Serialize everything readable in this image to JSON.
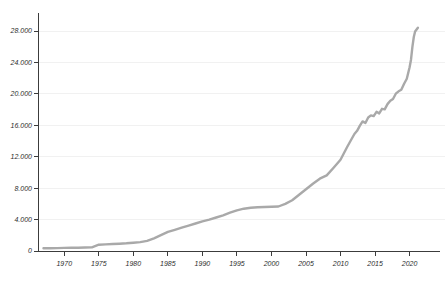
{
  "window": {
    "background": "#ffffff"
  },
  "chart_data": {
    "type": "line",
    "title": "",
    "xlabel": "",
    "ylabel": "",
    "legend": "none",
    "grid": "horizontal-faint",
    "colors": {
      "line": "#a9a9a9",
      "axis": "#3c3c3c",
      "grid": "#f1f1f1",
      "tick_label": "#2d2d2d"
    },
    "xlim": [
      1966.2,
      2024.4
    ],
    "ylim": [
      0,
      30300
    ],
    "x_ticks": [
      1970,
      1975,
      1980,
      1985,
      1990,
      1995,
      2000,
      2005,
      2010,
      2015,
      2020
    ],
    "x_tick_labels": [
      "1970",
      "1975",
      "1980",
      "1985",
      "1990",
      "1995",
      "2000",
      "2005",
      "2010",
      "2015",
      "2020"
    ],
    "y_ticks": [
      0,
      4000,
      8000,
      12000,
      16000,
      20000,
      24000,
      28000
    ],
    "y_tick_labels": [
      "0",
      "4.000",
      "8.000",
      "12.000",
      "16.000",
      "20.000",
      "24.000",
      "28.000"
    ],
    "series": [
      {
        "name": "series-1",
        "points": [
          [
            1967,
            350
          ],
          [
            1968,
            360
          ],
          [
            1969,
            375
          ],
          [
            1970,
            390
          ],
          [
            1971,
            405
          ],
          [
            1972,
            420
          ],
          [
            1973,
            440
          ],
          [
            1974,
            460
          ],
          [
            1975,
            800
          ],
          [
            1976,
            845
          ],
          [
            1977,
            890
          ],
          [
            1978,
            935
          ],
          [
            1979,
            985
          ],
          [
            1980,
            1060
          ],
          [
            1981,
            1130
          ],
          [
            1982,
            1290
          ],
          [
            1983,
            1600
          ],
          [
            1984,
            2010
          ],
          [
            1985,
            2450
          ],
          [
            1986,
            2700
          ],
          [
            1987,
            2960
          ],
          [
            1988,
            3230
          ],
          [
            1989,
            3500
          ],
          [
            1990,
            3780
          ],
          [
            1991,
            3990
          ],
          [
            1992,
            4260
          ],
          [
            1993,
            4550
          ],
          [
            1994,
            4870
          ],
          [
            1995,
            5180
          ],
          [
            1996,
            5380
          ],
          [
            1997,
            5500
          ],
          [
            1998,
            5560
          ],
          [
            1999,
            5600
          ],
          [
            2000,
            5640
          ],
          [
            2001,
            5660
          ],
          [
            2002,
            6000
          ],
          [
            2003,
            6460
          ],
          [
            2004,
            7150
          ],
          [
            2005,
            7860
          ],
          [
            2006,
            8550
          ],
          [
            2007,
            9200
          ],
          [
            2008,
            9620
          ],
          [
            2009,
            10600
          ],
          [
            2010,
            11620
          ],
          [
            2011,
            13300
          ],
          [
            2012,
            14900
          ],
          [
            2012.4,
            15300
          ],
          [
            2012.8,
            15950
          ],
          [
            2013.2,
            16500
          ],
          [
            2013.6,
            16300
          ],
          [
            2014,
            17000
          ],
          [
            2014.4,
            17260
          ],
          [
            2014.8,
            17180
          ],
          [
            2015.2,
            17720
          ],
          [
            2015.6,
            17520
          ],
          [
            2016,
            18100
          ],
          [
            2016.4,
            18030
          ],
          [
            2016.8,
            18700
          ],
          [
            2017.2,
            19120
          ],
          [
            2017.6,
            19350
          ],
          [
            2018,
            20020
          ],
          [
            2018.4,
            20330
          ],
          [
            2018.8,
            20520
          ],
          [
            2019.2,
            21300
          ],
          [
            2019.6,
            21940
          ],
          [
            2020,
            23400
          ],
          [
            2020.2,
            24350
          ],
          [
            2020.4,
            26000
          ],
          [
            2020.6,
            27250
          ],
          [
            2020.8,
            27950
          ],
          [
            2021.2,
            28430
          ]
        ]
      }
    ]
  }
}
